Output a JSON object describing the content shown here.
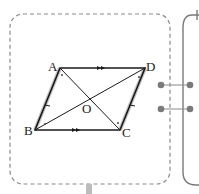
{
  "diagram": {
    "type": "parallelogram",
    "vertices": {
      "A": {
        "label": "A",
        "x": 60,
        "y": 68
      },
      "D": {
        "label": "D",
        "x": 145,
        "y": 68
      },
      "B": {
        "label": "B",
        "x": 35,
        "y": 130
      },
      "C": {
        "label": "C",
        "x": 120,
        "y": 130
      },
      "O": {
        "label": "O",
        "x": 90,
        "y": 99
      }
    },
    "markings": {
      "parallel_arrows": [
        "AD",
        "BC"
      ],
      "equal_sides_highlight": [
        "AB",
        "CD"
      ],
      "angle_dots": [
        "A",
        "B",
        "C",
        "D"
      ]
    },
    "colors": {
      "line": "#1a1a1a",
      "dashed_border": "#8a8a8a",
      "highlight": "#bdbdbd",
      "connector": "#7a7a7a"
    }
  }
}
